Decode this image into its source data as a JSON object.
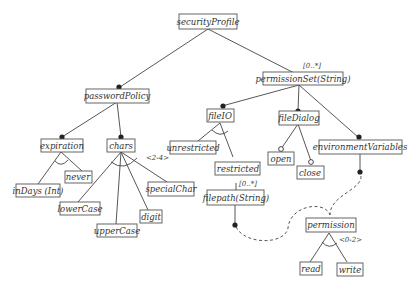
{
  "diagram": {
    "type": "feature-model",
    "nodes": {
      "securityProfile": "securityProfile",
      "passwordPolicy": "passwordPolicy",
      "permissionSet": "permissionSet(String)",
      "expiration": "expiration",
      "chars": "chars",
      "inDays": "inDays (Int)",
      "never": "never",
      "lowerCase": "lowerCase",
      "upperCase": "upperCase",
      "digit": "digit",
      "specialChar": "specialChar",
      "fileIO": "fileIO",
      "fileDialog": "fileDialog",
      "environmentVariables": "environmentVariables",
      "unrestricted": "unrestricted",
      "restricted": "restricted",
      "filepath": "filepath(String)",
      "open": "open",
      "close": "close",
      "permission": "permission",
      "read": "read",
      "write": "write"
    },
    "annotations": {
      "permissionSetCardinality": "[0..*]",
      "charsGroup": "<2-4>",
      "filepathCardinality": "[0..*]",
      "permissionGroup": "<0-2>"
    }
  }
}
